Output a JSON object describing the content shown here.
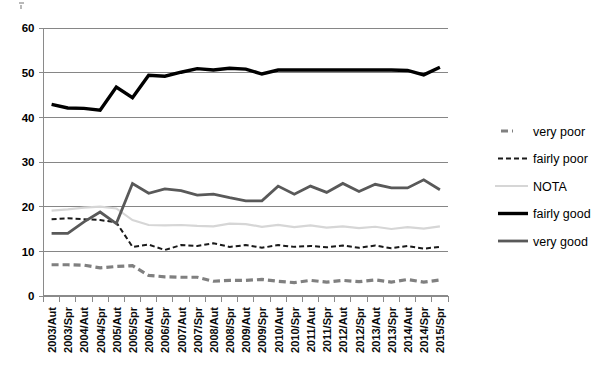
{
  "chart_data": {
    "type": "line",
    "title": "",
    "subtitle": "",
    "xlabel": "",
    "ylabel": "",
    "ylim": [
      0,
      60
    ],
    "ytick_values": [
      0,
      10,
      20,
      30,
      40,
      50,
      60
    ],
    "ytick_labels": [
      "0",
      "10",
      "20",
      "30",
      "40",
      "50",
      "60"
    ],
    "grid": true,
    "legend_position": "right",
    "categories": [
      "2003/Aut",
      "2003/Spr",
      "2004/Aut",
      "2004/Spr",
      "2005/Aut",
      "2005/Spr",
      "2006/Aut",
      "2006/Spr",
      "2007/Aut",
      "2007/Spr",
      "2008/Aut",
      "2008/Spr",
      "2009/Aut",
      "2009/Spr",
      "2010/Aut",
      "2010/Spr",
      "2011/Aut",
      "2011/Spr",
      "2012/Aut",
      "2012/Spr",
      "2013/Aut",
      "2013/Spr",
      "2014/Aut",
      "2014/Spr",
      "2015/Spr"
    ],
    "series": [
      {
        "name": "very poor",
        "color": "#808080",
        "style": "dashed-thick",
        "width": 3.2,
        "dash": "7,4",
        "values": [
          7.0,
          7.0,
          6.9,
          6.3,
          6.6,
          6.8,
          4.6,
          4.3,
          4.2,
          4.2,
          3.3,
          3.5,
          3.5,
          3.7,
          3.3,
          3.0,
          3.5,
          3.1,
          3.5,
          3.2,
          3.6,
          3.1,
          3.7,
          3.1,
          3.6
        ]
      },
      {
        "name": "fairly poor",
        "color": "#1a1a1a",
        "style": "dashed-thin",
        "width": 2.0,
        "dash": "5,3",
        "values": [
          17.2,
          17.4,
          17.2,
          17.0,
          16.5,
          11.0,
          11.5,
          10.3,
          11.4,
          11.2,
          11.8,
          11.0,
          11.4,
          10.8,
          11.4,
          11.0,
          11.2,
          10.9,
          11.3,
          10.8,
          11.3,
          10.7,
          11.2,
          10.6,
          11.0
        ]
      },
      {
        "name": "NOTA",
        "color": "#d6d6d6",
        "style": "solid-thin",
        "width": 2.2,
        "dash": "none",
        "values": [
          19.1,
          19.4,
          19.8,
          20.0,
          19.6,
          17.0,
          15.9,
          15.8,
          15.9,
          15.7,
          15.6,
          16.2,
          16.1,
          15.5,
          15.9,
          15.4,
          15.8,
          15.3,
          15.6,
          15.2,
          15.5,
          15.0,
          15.4,
          15.1,
          15.6
        ]
      },
      {
        "name": "fairly good",
        "color": "#000000",
        "style": "solid-thick",
        "width": 3.4,
        "dash": "none",
        "values": [
          42.9,
          42.1,
          42.0,
          41.6,
          46.8,
          44.4,
          49.4,
          49.2,
          50.1,
          50.9,
          50.6,
          51.0,
          50.8,
          49.7,
          50.6,
          50.6,
          50.6,
          50.6,
          50.6,
          50.6,
          50.6,
          50.6,
          50.5,
          49.5,
          51.2
        ]
      },
      {
        "name": "very good",
        "color": "#595959",
        "style": "solid-medium",
        "width": 2.8,
        "dash": "none",
        "values": [
          14.0,
          14.0,
          16.6,
          18.8,
          16.2,
          25.2,
          23.0,
          24.0,
          23.6,
          22.6,
          22.8,
          22.0,
          21.3,
          21.3,
          24.6,
          22.8,
          24.6,
          23.2,
          25.2,
          23.4,
          25.0,
          24.2,
          24.2,
          26.0,
          23.8
        ]
      }
    ]
  },
  "legend": {
    "entries": [
      {
        "label": "very poor"
      },
      {
        "label": "fairly poor"
      },
      {
        "label": "NOTA"
      },
      {
        "label": "fairly good"
      },
      {
        "label": "very good"
      }
    ]
  }
}
